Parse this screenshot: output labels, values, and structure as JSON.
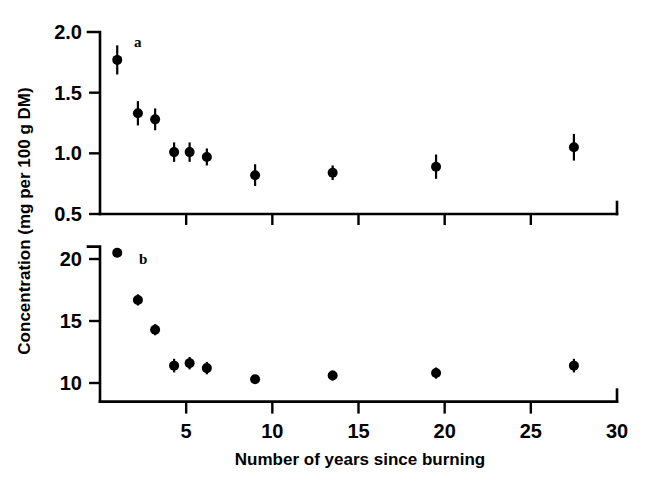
{
  "figure": {
    "background": "#ffffff",
    "ink_color": "#000000",
    "axis_title_x": "Number of years since burning",
    "axis_title_y": "Concentration (mg per 100 g DM)",
    "panel_a_label": "a",
    "panel_b_label": "b"
  },
  "chart_data": [
    {
      "type": "scatter",
      "panel": "a",
      "title": "a",
      "xlabel": "Number of years since burning",
      "ylabel": "Concentration (mg per 100 g DM)",
      "xlim": [
        0,
        30
      ],
      "ylim": [
        0.5,
        2.0
      ],
      "xticks": [
        5,
        10,
        15,
        20,
        25,
        30
      ],
      "xtick_labels": [
        "5",
        "10",
        "15",
        "20",
        "25",
        "30"
      ],
      "yticks": [
        0.5,
        1.0,
        1.5,
        2.0
      ],
      "ytick_labels": [
        "0.5",
        "1.0",
        "1.5",
        "2.0"
      ],
      "grid": false,
      "legend": "none",
      "error_bars": "vertical",
      "x": [
        1.0,
        2.2,
        3.2,
        4.3,
        5.2,
        6.2,
        9.0,
        13.5,
        19.5,
        27.5
      ],
      "values": [
        1.77,
        1.33,
        1.28,
        1.01,
        1.01,
        0.97,
        0.82,
        0.84,
        0.89,
        1.05
      ],
      "yerr": [
        0.12,
        0.1,
        0.09,
        0.08,
        0.08,
        0.07,
        0.09,
        0.06,
        0.1,
        0.11
      ]
    },
    {
      "type": "scatter",
      "panel": "b",
      "title": "b",
      "xlabel": "Number of years since burning",
      "ylabel": "Concentration (mg per 100 g DM)",
      "xlim": [
        0,
        30
      ],
      "ylim": [
        8.5,
        21.0
      ],
      "xticks": [
        5,
        10,
        15,
        20,
        25,
        30
      ],
      "xtick_labels": [
        "5",
        "10",
        "15",
        "20",
        "25",
        "30"
      ],
      "yticks": [
        10,
        15,
        20
      ],
      "ytick_labels": [
        "10",
        "15",
        "20"
      ],
      "grid": false,
      "legend": "none",
      "error_bars": "vertical",
      "x": [
        1.0,
        2.2,
        3.2,
        4.3,
        5.2,
        6.2,
        9.0,
        13.5,
        19.5,
        27.5
      ],
      "values": [
        20.5,
        16.7,
        14.3,
        11.4,
        11.6,
        11.2,
        10.3,
        10.6,
        10.8,
        11.4
      ],
      "yerr": [
        0.35,
        0.45,
        0.45,
        0.55,
        0.5,
        0.5,
        0.35,
        0.4,
        0.45,
        0.55
      ]
    }
  ]
}
